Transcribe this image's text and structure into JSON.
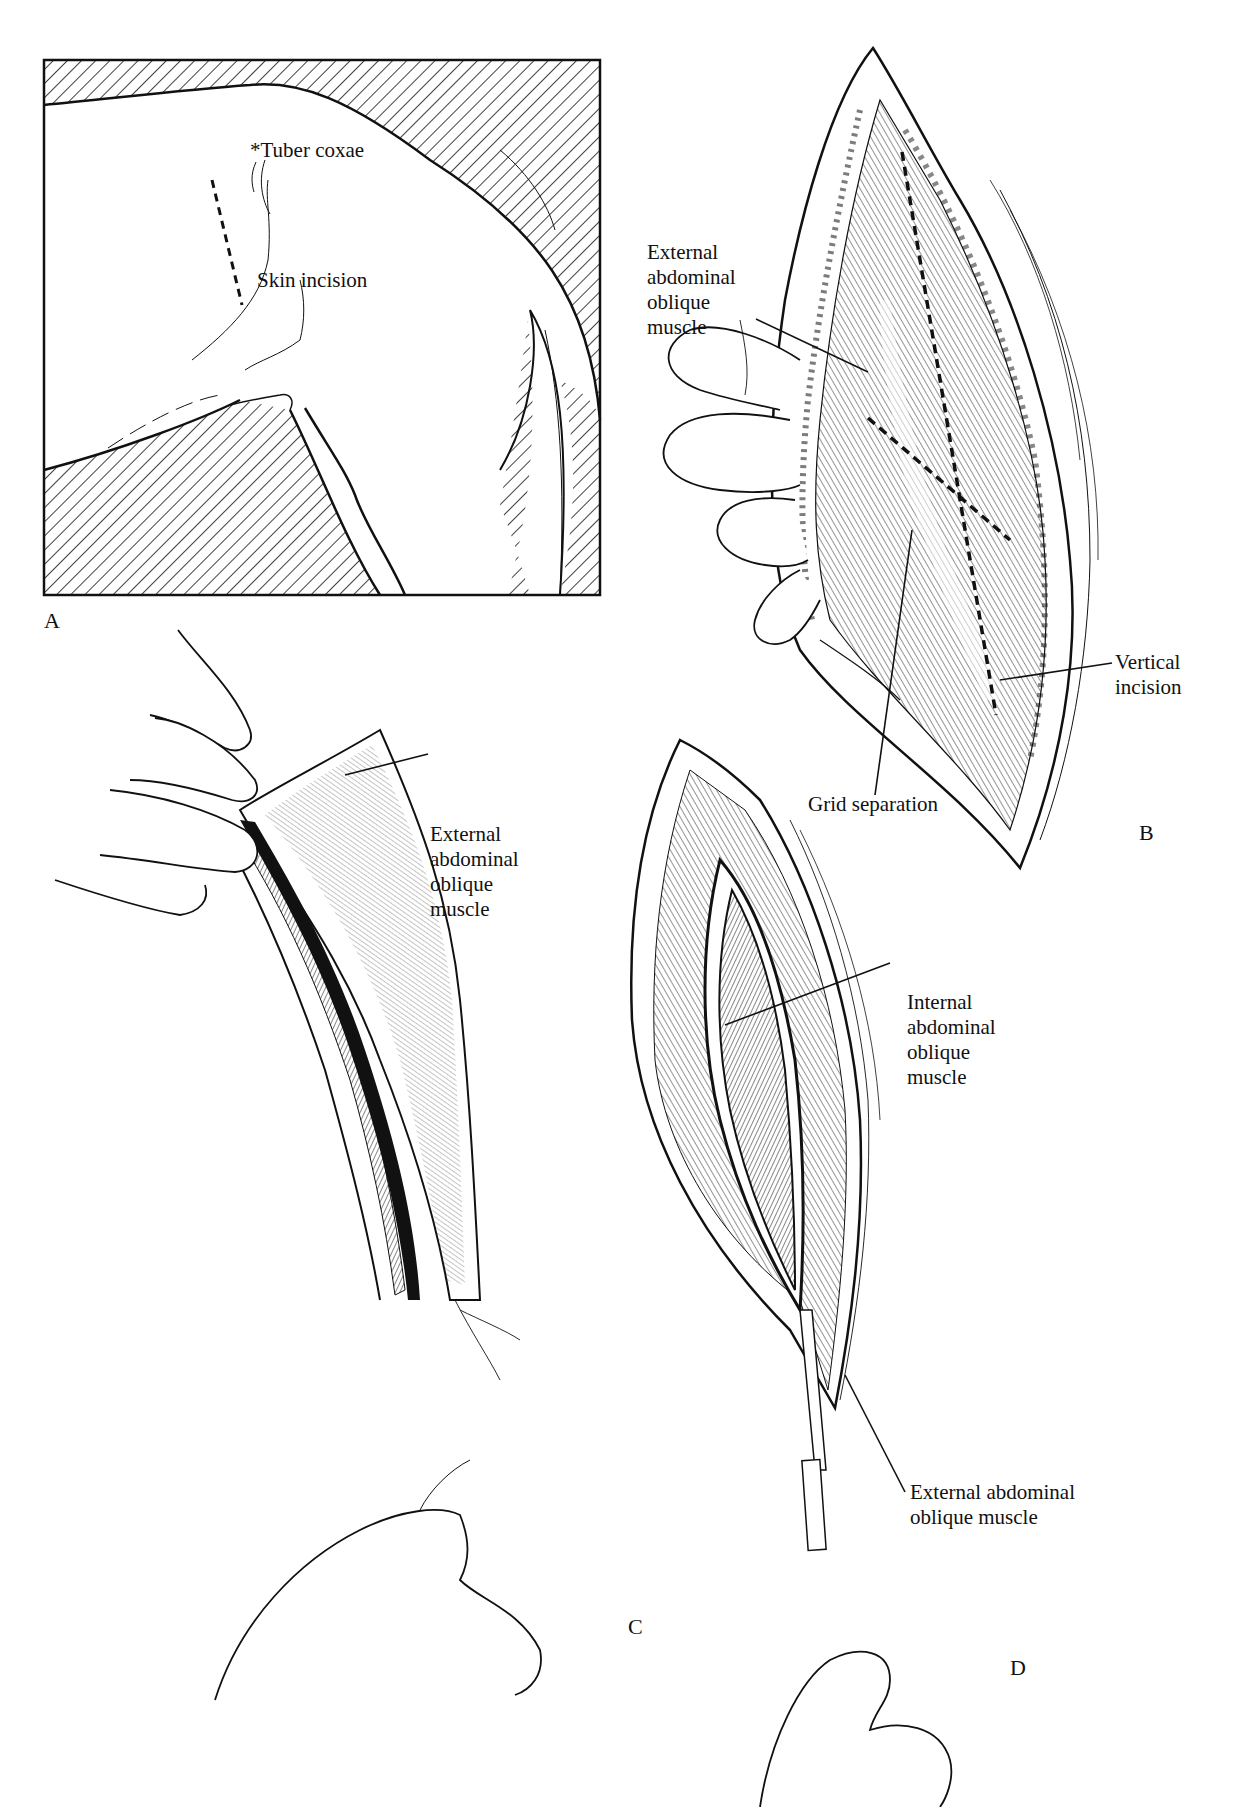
{
  "figure": {
    "panels": [
      {
        "id": "A",
        "letter": "A",
        "labels": {
          "tuber_coxae": "*Tuber coxae",
          "skin_incision": "Skin incision"
        }
      },
      {
        "id": "B",
        "letter": "B",
        "labels": {
          "external_oblique": "External\nabdominal\noblique\nmuscle",
          "vertical_incision": "Vertical\nincision",
          "grid_separation": "Grid separation"
        }
      },
      {
        "id": "C",
        "letter": "C",
        "labels": {
          "external_oblique": "External\nabdominal\noblique\nmuscle"
        }
      },
      {
        "id": "D",
        "letter": "D",
        "labels": {
          "internal_oblique": "Internal\nabdominal\noblique\nmuscle",
          "external_oblique": "External abdominal\noblique muscle"
        }
      }
    ],
    "colors": {
      "ink": "#111111",
      "paper": "#ffffff"
    }
  }
}
